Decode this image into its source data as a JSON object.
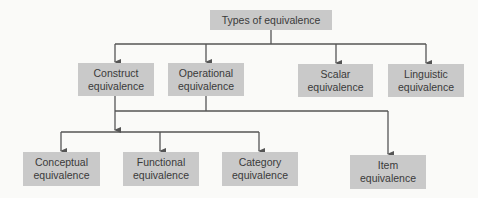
{
  "diagram": {
    "type": "hierarchy",
    "colors": {
      "box_fill": "#c9c9c9",
      "text": "#3a3a3a",
      "connector": "#555555",
      "background": "#fafaf8"
    },
    "root": {
      "label": "Types of equivalence"
    },
    "level2": [
      {
        "id": "construct",
        "line1": "Construct",
        "line2": "equivalence"
      },
      {
        "id": "operational",
        "line1": "Operational",
        "line2": "equivalence"
      },
      {
        "id": "scalar",
        "line1": "Scalar",
        "line2": "equivalence"
      },
      {
        "id": "linguistic",
        "line1": "Linguistic",
        "line2": "equivalence"
      }
    ],
    "level3": [
      {
        "id": "conceptual",
        "line1": "Conceptual",
        "line2": "equivalence"
      },
      {
        "id": "functional",
        "line1": "Functional",
        "line2": "equivalence"
      },
      {
        "id": "category",
        "line1": "Category",
        "line2": "equivalence"
      },
      {
        "id": "item",
        "line1": "Item",
        "line2": "equivalence"
      }
    ],
    "edges": [
      {
        "from": "Types of equivalence",
        "to": "Construct equivalence"
      },
      {
        "from": "Types of equivalence",
        "to": "Operational equivalence"
      },
      {
        "from": "Types of equivalence",
        "to": "Scalar equivalence"
      },
      {
        "from": "Types of equivalence",
        "to": "Linguistic equivalence"
      },
      {
        "from": "Construct equivalence + Operational equivalence",
        "to": "Conceptual equivalence"
      },
      {
        "from": "Construct equivalence + Operational equivalence",
        "to": "Functional equivalence"
      },
      {
        "from": "Construct equivalence + Operational equivalence",
        "to": "Category equivalence"
      },
      {
        "from": "Construct equivalence + Operational equivalence",
        "to": "Item equivalence"
      }
    ]
  }
}
